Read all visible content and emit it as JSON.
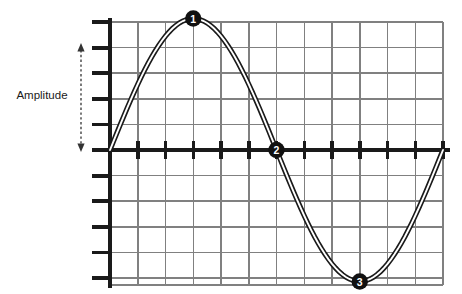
{
  "figure": {
    "title": "",
    "amplitude_label": "Amplitude",
    "markers": [
      {
        "id": "1",
        "label": "1",
        "x_cell": 2.5,
        "y_value": 5,
        "description": "crest"
      },
      {
        "id": "2",
        "label": "2",
        "x_cell": 6.0,
        "y_value": 0,
        "description": "zero-crossing"
      },
      {
        "id": "3",
        "label": "3",
        "x_cell": 9.5,
        "y_value": -5,
        "description": "trough"
      }
    ],
    "colors": {
      "axis": "#1a1a1a",
      "grid": "#808080",
      "curve_outline": "#1a1a1a",
      "curve_fill": "#ffffff",
      "marker_fill": "#111111",
      "marker_text": "#ffffff",
      "amplitude_arrow": "#333333",
      "background": "#ffffff"
    }
  },
  "chart_data": {
    "type": "line",
    "title": "",
    "xlabel": "",
    "ylabel": "Amplitude",
    "grid": true,
    "legend_position": "none",
    "xlim": [
      0,
      12
    ],
    "ylim": [
      -5,
      5
    ],
    "x_ticks": [
      0,
      1,
      2,
      3,
      4,
      5,
      6,
      7,
      8,
      9,
      10,
      11,
      12
    ],
    "y_ticks": [
      -5,
      -4,
      -3,
      -2,
      -1,
      0,
      1,
      2,
      3,
      4,
      5
    ],
    "x_tick_labels": [
      "",
      "",
      "",
      "",
      "",
      "",
      "",
      "",
      "",
      "",
      "",
      "",
      ""
    ],
    "y_tick_labels": [
      "",
      "",
      "",
      "",
      "",
      "",
      "",
      "",
      "",
      "",
      ""
    ],
    "grid_columns": 12,
    "grid_rows": 10,
    "series": [
      {
        "name": "sine wave",
        "function": "y = 5 * sin(2*pi*x/12)",
        "amplitude": 5,
        "period": 12,
        "x": [
          0,
          0.5,
          1,
          1.5,
          2,
          2.5,
          3,
          3.5,
          4,
          4.5,
          5,
          5.5,
          6,
          6.5,
          7,
          7.5,
          8,
          8.5,
          9,
          9.5,
          10,
          10.5,
          11,
          11.5,
          12
        ],
        "values": [
          0,
          1.29,
          2.5,
          3.54,
          4.33,
          4.83,
          5,
          4.83,
          4.33,
          3.54,
          2.5,
          1.29,
          0,
          -1.29,
          -2.5,
          -3.54,
          -4.33,
          -4.83,
          -5,
          -4.83,
          -4.33,
          -3.54,
          -2.5,
          -1.29,
          0
        ]
      }
    ],
    "annotations": [
      {
        "label": "1",
        "x": 3,
        "y": 5
      },
      {
        "label": "2",
        "x": 6,
        "y": 0
      },
      {
        "label": "3",
        "x": 9,
        "y": -5
      }
    ]
  }
}
